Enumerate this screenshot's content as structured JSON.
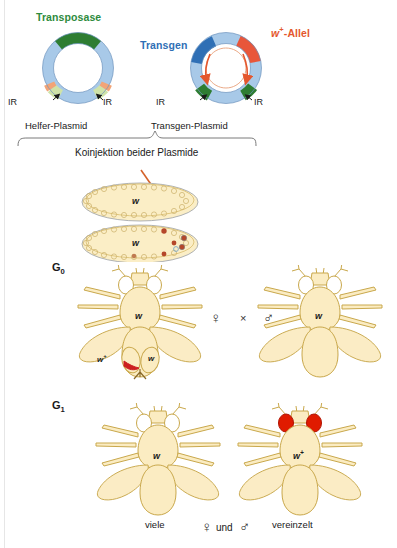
{
  "figure": {
    "title_hidden": "P-Element Transformation bei Drosophila",
    "language": "de"
  },
  "plasmids": {
    "helper": {
      "gene_label": "Transposase",
      "gene_color": "#2e7d32",
      "ring_color": "#a8c9e8",
      "ir_color": "#cfe3a8",
      "marker_color": "#f2a477",
      "ir_left_label": "IR",
      "ir_right_label": "IR",
      "caption": "Helfer-Plasmid"
    },
    "transgene": {
      "gene_label": "Transgen",
      "gene_color": "#2f6fb5",
      "allele_label": "w⁺-Allel",
      "allele_label_plain": "w",
      "allele_sup": "+",
      "allele_color": "#e4572e",
      "ring_color": "#a8c9e8",
      "ir_color": "#2e7d32",
      "arrow_color": "#e4572e",
      "ir_left_label": "IR",
      "ir_right_label": "IR",
      "caption": "Transgen-Plasmid"
    }
  },
  "injection": {
    "label": "Koinjektion beider Plasmide",
    "arrow_color": "#d4622a"
  },
  "embryos": [
    {
      "name": "embryo-before-injection",
      "genotype": "w",
      "has_transformed_cells": false
    },
    {
      "name": "embryo-after-injection",
      "genotype": "w",
      "has_transformed_cells": true,
      "germ_cell_color": "#b5472a"
    }
  ],
  "generations": {
    "g0": {
      "label": "G",
      "sub": "0",
      "female": {
        "genotype": "w",
        "eye_color": "white",
        "symbol": "♀",
        "ovary_left_label": "w⁺",
        "ovary_left_plain": "w",
        "ovary_left_sup": "+",
        "ovary_right_label": "w",
        "ovary_marked_color": "#cc1f1f"
      },
      "cross_symbol": "×",
      "male": {
        "genotype": "w",
        "eye_color": "white",
        "symbol": "♂"
      }
    },
    "g1": {
      "label": "G",
      "sub": "1",
      "offspring": [
        {
          "genotype": "w",
          "genotype_sup": "",
          "eye_color": "white",
          "eye_hex": "#ffffff",
          "frequency": "viele"
        },
        {
          "genotype": "w",
          "genotype_sup": "+",
          "eye_color": "red",
          "eye_hex": "#e01b00",
          "frequency": "vereinzelt"
        }
      ],
      "sex_note": {
        "female": "♀",
        "und": "und",
        "male": "♂"
      }
    }
  },
  "colors": {
    "body_fill": "#fbecc2",
    "body_stroke": "#c9a84c",
    "wing_fill": "#fbecc2",
    "embryo_fill": "#fbeec6",
    "embryo_stroke": "#c9a84c"
  }
}
